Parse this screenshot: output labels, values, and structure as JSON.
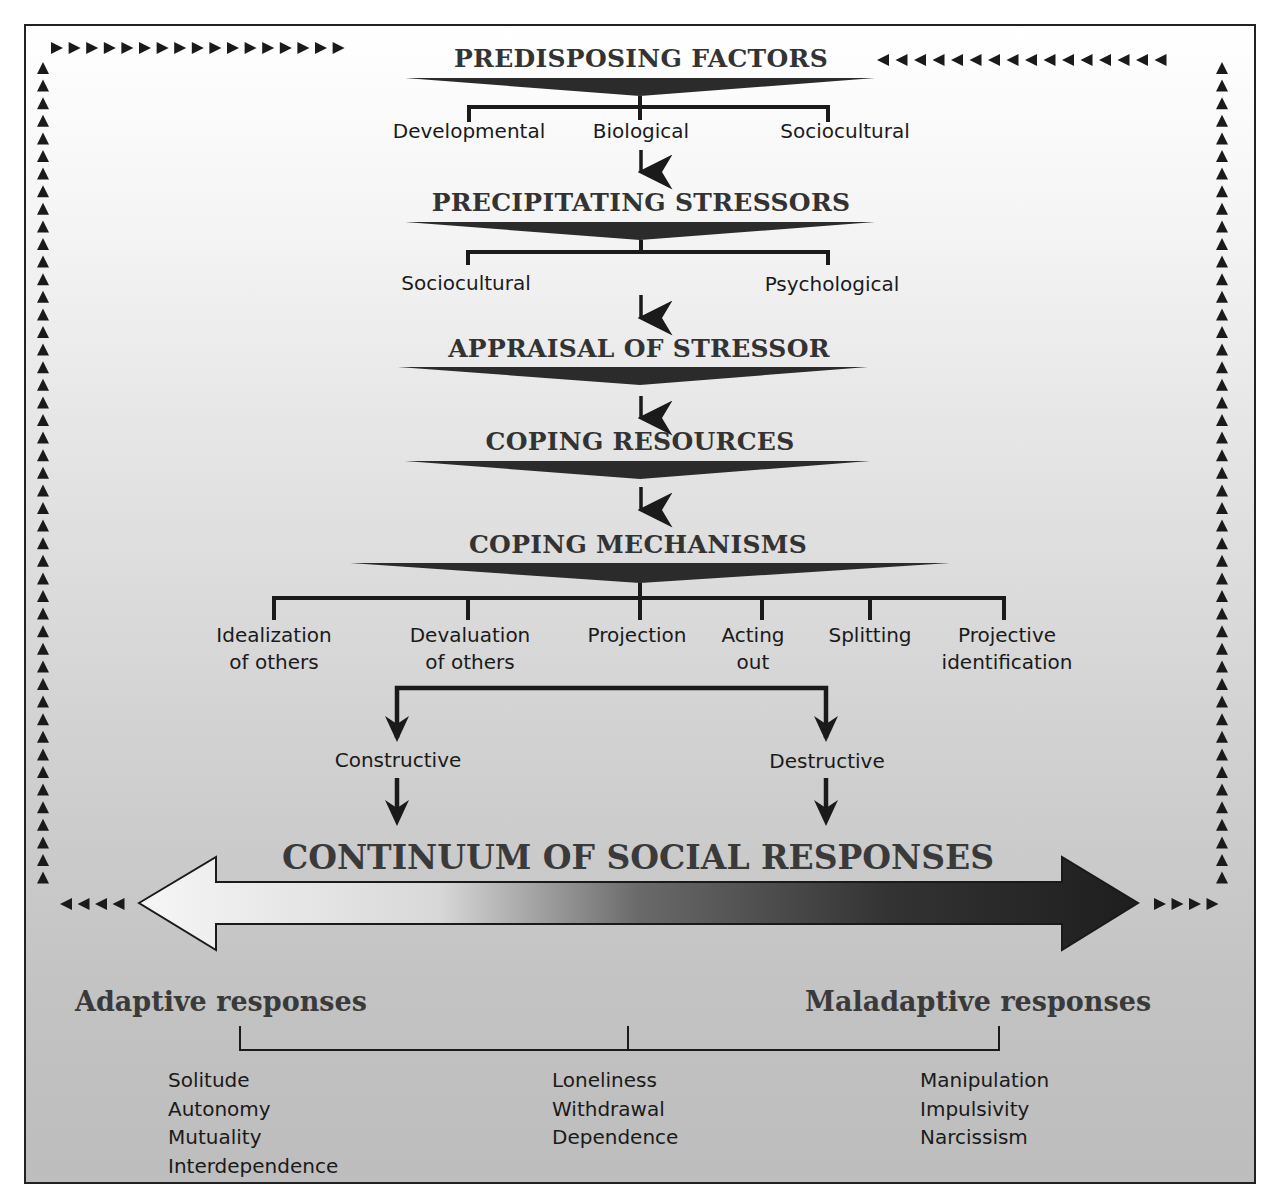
{
  "predisposing": {
    "title": "PREDISPOSING FACTORS",
    "items": [
      "Developmental",
      "Biological",
      "Sociocultural"
    ]
  },
  "precipitating": {
    "title": "PRECIPITATING STRESSORS",
    "items": [
      "Sociocultural",
      "Psychological"
    ]
  },
  "appraisal": {
    "title": "APPRAISAL OF STRESSOR"
  },
  "resources": {
    "title": "COPING RESOURCES"
  },
  "mechanisms": {
    "title": "COPING MECHANISMS",
    "items": [
      {
        "line1": "Idealization",
        "line2": "of others"
      },
      {
        "line1": "Devaluation",
        "line2": "of others"
      },
      {
        "line1": "Projection",
        "line2": ""
      },
      {
        "line1": "Acting",
        "line2": "out"
      },
      {
        "line1": "Splitting",
        "line2": ""
      },
      {
        "line1": "Projective",
        "line2": "identification"
      }
    ]
  },
  "branches": {
    "constructive": "Constructive",
    "destructive": "Destructive"
  },
  "continuum": {
    "title": "CONTINUUM OF SOCIAL RESPONSES",
    "gradient_start": "#f4f4f4",
    "gradient_end": "#1e1e1e"
  },
  "responses": {
    "adaptive_label": "Adaptive responses",
    "maladaptive_label": "Maladaptive responses",
    "adaptive": [
      "Solitude",
      "Autonomy",
      "Mutuality",
      "Interdependence"
    ],
    "middle": [
      "Loneliness",
      "Withdrawal",
      "Dependence"
    ],
    "maladaptive": [
      "Manipulation",
      "Impulsivity",
      "Narcissism"
    ]
  },
  "colors": {
    "ink": "#1a1a1a",
    "heading": "#333333",
    "frame": "#222222"
  }
}
